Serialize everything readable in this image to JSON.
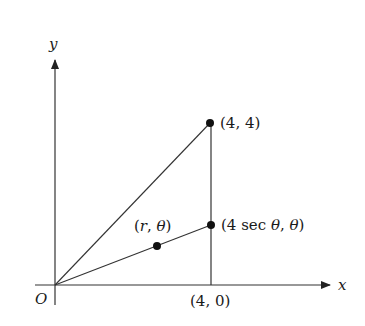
{
  "diagram": {
    "axes": {
      "x_label": "x",
      "y_label": "y",
      "origin_label": "O"
    },
    "points": [
      {
        "id": "p44",
        "label": "(4, 4)",
        "x": 210,
        "y": 123
      },
      {
        "id": "psec",
        "label": "(4 sec θ, θ)",
        "x": 211,
        "y": 225
      },
      {
        "id": "prt",
        "label": "(r, θ)",
        "x": 157,
        "y": 246
      }
    ],
    "tick_labels": {
      "x40": "(4, 0)"
    },
    "labels": {
      "p44": "(4, 4)",
      "psec_prefix": "(4 sec ",
      "theta": "θ",
      "comma": ", ",
      "close": ")",
      "prt_open": "(",
      "r": "r",
      "x40": "(4, 0)"
    },
    "colors": {
      "stroke": "#222222",
      "axis": "#333333"
    }
  }
}
